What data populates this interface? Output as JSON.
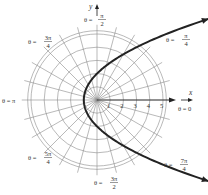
{
  "chart_data": {
    "type": "line",
    "title": "",
    "coordinate_system": "polar",
    "equation": "r = 2/(1 - cos θ)",
    "xlabel": "x",
    "ylabel": "y",
    "radial_ticks": [
      "1",
      "2",
      "3",
      "4",
      "5"
    ],
    "radial_range": [
      0,
      5
    ],
    "angular_grid_step_deg": 15,
    "angle_labels": [
      {
        "theta_deg": 90,
        "text": "θ = ",
        "num": "π",
        "den": "2"
      },
      {
        "theta_deg": 135,
        "text": "θ = ",
        "num": "3π",
        "den": "4"
      },
      {
        "theta_deg": 45,
        "text": "θ = ",
        "num": "π",
        "den": "4"
      },
      {
        "theta_deg": 180,
        "text": "θ = π",
        "num": "",
        "den": ""
      },
      {
        "theta_deg": 0,
        "text": "θ = 0",
        "num": "",
        "den": ""
      },
      {
        "theta_deg": 225,
        "text": "θ = ",
        "num": "5π",
        "den": "4"
      },
      {
        "theta_deg": 270,
        "text": "θ = ",
        "num": "3π",
        "den": "2"
      },
      {
        "theta_deg": 315,
        "text": "θ = ",
        "num": "7π",
        "den": "4"
      }
    ],
    "series": [
      {
        "name": "parabola",
        "k": 2,
        "theta_range_deg": [
          36,
          324
        ]
      }
    ],
    "grid": true
  }
}
